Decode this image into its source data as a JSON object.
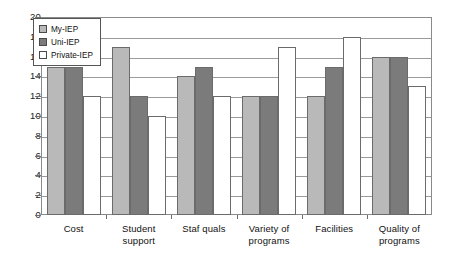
{
  "chart_data": {
    "type": "bar",
    "title": "",
    "xlabel": "",
    "ylabel": "",
    "ylim": [
      0,
      20
    ],
    "ytick_step": 2,
    "grid": true,
    "legend_position": "top-left",
    "categories": [
      "Cost",
      "Student support",
      "Staf quals",
      "Variety of programs",
      "Facilities",
      "Quality of programs"
    ],
    "series": [
      {
        "name": "My-IEP",
        "color": "#b9b9b9",
        "values": [
          15,
          17,
          14,
          12,
          12,
          16
        ]
      },
      {
        "name": "Uni-IEP",
        "color": "#7b7b7b",
        "values": [
          15,
          12,
          15,
          12,
          15,
          16
        ]
      },
      {
        "name": "Private-IEP",
        "color": "#ffffff",
        "values": [
          12,
          10,
          12,
          17,
          18,
          13
        ]
      }
    ],
    "ytick_labels": [
      "20",
      "18",
      "16",
      "14",
      "12",
      "10",
      "8",
      "6",
      "4",
      "2",
      "0"
    ],
    "ytick_values": [
      20,
      18,
      16,
      14,
      12,
      10,
      8,
      6,
      4,
      2,
      0
    ],
    "category_lines": [
      [
        "Cost"
      ],
      [
        "Student",
        "support"
      ],
      [
        "Staf quals"
      ],
      [
        "Variety of",
        "programs"
      ],
      [
        "Facilities"
      ],
      [
        "Quality of",
        "programs"
      ]
    ]
  },
  "legend": {
    "items": [
      {
        "label": "My-IEP",
        "swatch": "legend-swatch-my-iep"
      },
      {
        "label": "Uni-IEP",
        "swatch": "legend-swatch-uni-iep"
      },
      {
        "label": "Private-IEP",
        "swatch": "legend-swatch-private-iep"
      }
    ]
  },
  "colors": {
    "series_1": "#b9b9b9",
    "series_2": "#7b7b7b",
    "series_3": "#ffffff",
    "bar_outline": "#6b6b6b",
    "gridline": "#9a9a9a",
    "frame": "#8a8a8a",
    "text": "#111111"
  }
}
